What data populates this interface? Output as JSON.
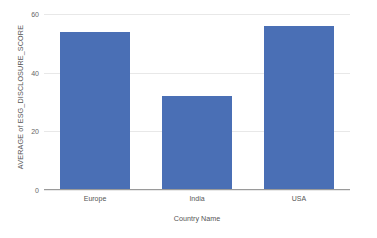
{
  "chart_data": {
    "type": "bar",
    "title": "",
    "subtitle": "",
    "xlabel": "Country Name",
    "ylabel": "AVERAGE of ESG_DISCLOSURE_SCORE",
    "categories": [
      "Europe",
      "India",
      "USA"
    ],
    "values": [
      53.7,
      32.0,
      56.0
    ],
    "series": [
      {
        "name": "AVERAGE of ESG_DISCLOSURE_SCORE",
        "values": [
          53.7,
          32.0,
          56.0
        ]
      }
    ],
    "ylim": [
      0,
      60
    ],
    "xlim": null,
    "yticks": [
      0,
      20,
      40,
      60
    ],
    "ytick_labels": [
      "0",
      "20",
      "40",
      "60"
    ],
    "grid": true,
    "grid_axis": "y",
    "legend": false,
    "legend_position": "none",
    "annotations": [],
    "colors": {
      "bar": "#4a6fb5",
      "gridline": "#e8e8e8",
      "axis": "#9a9a9a",
      "tick_text": "#666666",
      "label_text": "#555555",
      "background": "#ffffff"
    }
  }
}
